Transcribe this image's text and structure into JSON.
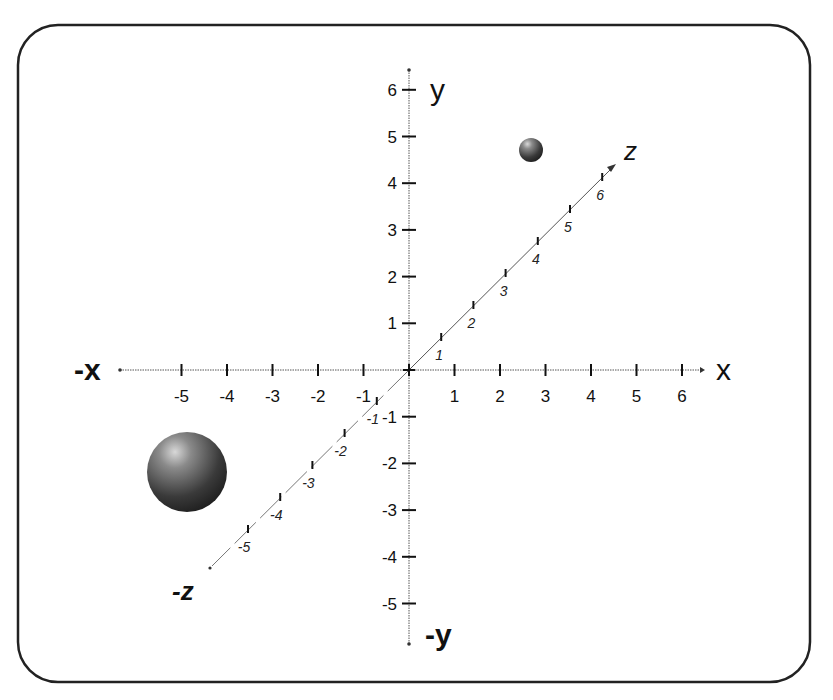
{
  "chart_data": {
    "type": "diagram",
    "title": "",
    "axes": {
      "x": {
        "positive_label": "x",
        "negative_label": "-x",
        "ticks": [
          -5,
          -4,
          -3,
          -2,
          -1,
          1,
          2,
          3,
          4,
          5,
          6
        ]
      },
      "y": {
        "positive_label": "y",
        "negative_label": "-y",
        "ticks": [
          6,
          5,
          4,
          3,
          2,
          1,
          -1,
          -2,
          -3,
          -4,
          -5
        ]
      },
      "z": {
        "positive_label": "z",
        "negative_label": "-z",
        "ticks": [
          1,
          2,
          3,
          4,
          5,
          6,
          -1,
          -2,
          -3,
          -4,
          -5
        ]
      }
    },
    "objects": [
      {
        "name": "small-sphere",
        "approx_position": "upper right quadrant near x≈2.7, y≈4.7",
        "size": "small"
      },
      {
        "name": "large-sphere",
        "approx_position": "lower left quadrant near x≈-4.9, y≈-2.2",
        "size": "large"
      }
    ],
    "grid": false
  },
  "labels": {
    "x_pos": "x",
    "x_neg": "-x",
    "y_pos": "y",
    "y_neg": "-y",
    "z_pos": "z",
    "z_neg": "-z"
  },
  "colors": {
    "axis": "#333333",
    "frame": "#222222",
    "sphere_dark": "#2a2a2a",
    "sphere_light": "#cfcfcf"
  }
}
